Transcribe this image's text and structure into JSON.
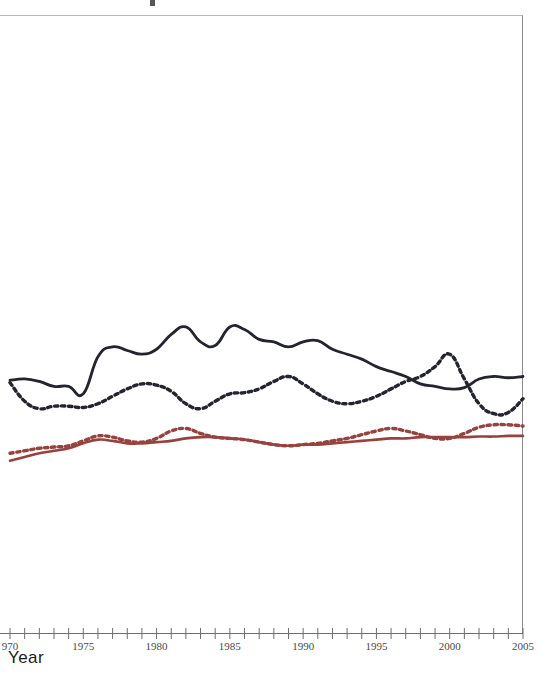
{
  "axis": {
    "x_title": "Year",
    "tick_labels": [
      "970",
      "1975",
      "1980",
      "1985",
      "1990",
      "1995",
      "2000",
      "2005"
    ],
    "tick_years": [
      1970,
      1975,
      1980,
      1985,
      1990,
      1995,
      2000,
      2005
    ]
  },
  "colors": {
    "series_navy": "#23252e",
    "series_maroon": "#96433f",
    "axis": "#6e6e6e",
    "border": "#b9b9b9",
    "background": "#ffffff",
    "tick_text": "#4a4a4a"
  },
  "chart_data": {
    "type": "line",
    "title": "",
    "subtitle": "",
    "xlabel": "Year",
    "ylabel": "",
    "xlim": [
      1970,
      2005
    ],
    "ylim": [
      0,
      100
    ],
    "grid": false,
    "legend": "none",
    "note": "Y axis is cropped out of the screenshot; y values below are read off pixel positions and expressed on an inferred 0-100 index scale where larger = higher on the plot.",
    "x": [
      1970,
      1971,
      1972,
      1973,
      1974,
      1975,
      1976,
      1977,
      1978,
      1979,
      1980,
      1981,
      1982,
      1983,
      1984,
      1985,
      1986,
      1987,
      1988,
      1989,
      1990,
      1991,
      1992,
      1993,
      1994,
      1995,
      1996,
      1997,
      1998,
      1999,
      2000,
      2001,
      2002,
      2003,
      2004,
      2005
    ],
    "series": [
      {
        "name": "navy-solid",
        "color": "#23252e",
        "style": "solid",
        "values": [
          41.0,
          41.2,
          40.8,
          40.0,
          40.0,
          38.8,
          44.8,
          46.4,
          45.8,
          45.2,
          46.0,
          48.4,
          49.6,
          47.2,
          46.6,
          49.6,
          49.2,
          47.6,
          47.2,
          46.4,
          47.2,
          47.4,
          46.0,
          45.2,
          44.4,
          43.2,
          42.4,
          41.6,
          40.4,
          40.0,
          39.6,
          39.8,
          41.2,
          41.6,
          41.4,
          41.6
        ]
      },
      {
        "name": "navy-dotted",
        "color": "#23252e",
        "style": "dotted",
        "values": [
          40.6,
          37.6,
          36.4,
          36.8,
          36.8,
          36.6,
          37.2,
          38.4,
          39.6,
          40.4,
          40.2,
          39.2,
          37.2,
          36.4,
          37.6,
          38.8,
          39.0,
          39.6,
          40.8,
          41.6,
          40.4,
          38.8,
          37.6,
          37.2,
          37.6,
          38.4,
          39.6,
          40.8,
          41.6,
          43.2,
          45.2,
          41.2,
          37.2,
          35.6,
          35.8,
          38.0
        ]
      },
      {
        "name": "maroon-solid",
        "color": "#96433f",
        "style": "solid",
        "values": [
          28.0,
          28.6,
          29.2,
          29.6,
          30.0,
          30.8,
          31.4,
          31.2,
          30.8,
          30.8,
          31.0,
          31.2,
          31.6,
          31.8,
          31.8,
          31.6,
          31.4,
          31.0,
          30.6,
          30.4,
          30.6,
          30.6,
          30.8,
          31.0,
          31.2,
          31.4,
          31.6,
          31.6,
          31.8,
          31.8,
          31.8,
          31.8,
          31.9,
          31.9,
          32.0,
          32.0
        ]
      },
      {
        "name": "maroon-dotted",
        "color": "#96433f",
        "style": "dotted",
        "values": [
          29.2,
          29.6,
          30.0,
          30.2,
          30.4,
          31.2,
          32.0,
          31.8,
          31.2,
          31.0,
          31.6,
          32.8,
          33.2,
          32.4,
          31.8,
          31.6,
          31.4,
          31.0,
          30.6,
          30.4,
          30.6,
          30.8,
          31.2,
          31.6,
          32.2,
          32.8,
          33.2,
          32.8,
          32.2,
          31.6,
          31.6,
          32.4,
          33.4,
          33.8,
          33.8,
          33.6
        ]
      }
    ]
  }
}
